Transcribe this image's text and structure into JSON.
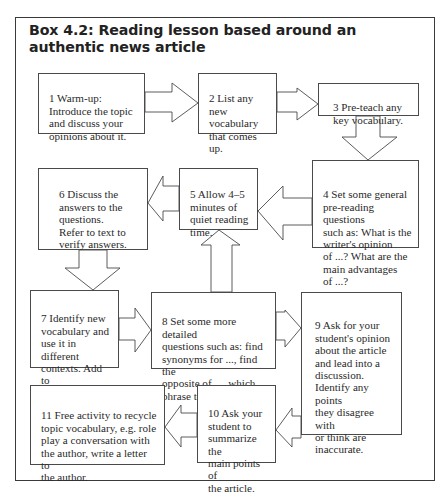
{
  "title": "Box 4.2: Reading lesson based around an authentic news article",
  "colors": {
    "border": "#4a4a4a",
    "text": "#2a2a2a",
    "background": "#ffffff"
  },
  "steps": [
    {
      "number": 1,
      "text": "1 Warm-up:\nIntroduce the topic\nand discuss your\nopinions about it."
    },
    {
      "number": 2,
      "text": "2 List any\nnew\nvocabulary\nthat comes up."
    },
    {
      "number": 3,
      "text": "3 Pre-teach any\nkey vocabulary."
    },
    {
      "number": 4,
      "text": "4 Set some general\npre-reading questions\nsuch as: What is the\nwriter's opinion\nof ...? What are the\nmain advantages\nof ...?"
    },
    {
      "number": 5,
      "text": "5 Allow 4–5\nminutes of\nquiet reading\ntime."
    },
    {
      "number": 6,
      "text": "6 Discuss the\nanswers to the\nquestions.\nRefer to text to\nverify answers."
    },
    {
      "number": 7,
      "text": "7 Identify new\nvocabulary and\nuse it in different\ncontexts. Add to\nlist."
    },
    {
      "number": 8,
      "text": "8 Set some more detailed\nquestions such as: find\nsynonyms for ..., find the\nopposite of ..., which\nphrase tells you that ...?"
    },
    {
      "number": 9,
      "text": "9 Ask for your\nstudent's opinion\nabout the article\nand lead into a\ndiscussion.\nIdentify any points\nthey disagree with\nor think are\ninaccurate."
    },
    {
      "number": 10,
      "text": "10 Ask your\nstudent to\nsummarize the\nmain points of\nthe article."
    },
    {
      "number": 11,
      "text": "11 Free activity to recycle\ntopic vocabulary, e.g. role\nplay a conversation with\nthe author, write a letter to\nthe author."
    }
  ],
  "flow": [
    {
      "from": 1,
      "to": 2,
      "direction": "right"
    },
    {
      "from": 2,
      "to": 3,
      "direction": "right"
    },
    {
      "from": 3,
      "to": 4,
      "direction": "down"
    },
    {
      "from": 4,
      "to": 5,
      "direction": "left"
    },
    {
      "from": 5,
      "to": 6,
      "direction": "left"
    },
    {
      "from": 6,
      "to": 7,
      "direction": "down"
    },
    {
      "from": 7,
      "to": 8,
      "direction": "right"
    },
    {
      "from": 8,
      "to": 5,
      "direction": "up"
    },
    {
      "from": 8,
      "to": 9,
      "direction": "right"
    },
    {
      "from": 9,
      "to": 10,
      "direction": "left"
    },
    {
      "from": 10,
      "to": 11,
      "direction": "left"
    }
  ]
}
